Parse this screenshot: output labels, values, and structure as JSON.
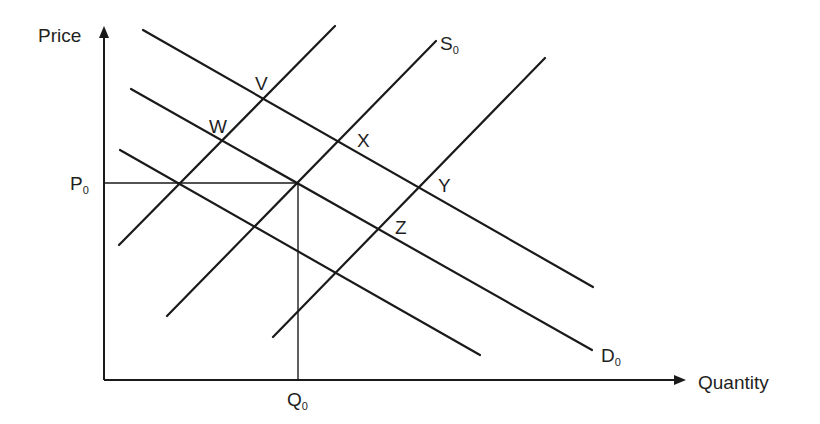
{
  "diagram": {
    "type": "supply-demand",
    "axes": {
      "y_label": "Price",
      "x_label": "Quantity"
    },
    "reference": {
      "price_label": "P",
      "price_sub": "0",
      "quantity_label": "Q",
      "quantity_sub": "0"
    },
    "curves": {
      "supply_label": "S",
      "supply_sub": "0",
      "demand_label": "D",
      "demand_sub": "0"
    },
    "points": [
      {
        "label": "V"
      },
      {
        "label": "W"
      },
      {
        "label": "X"
      },
      {
        "label": "Y"
      },
      {
        "label": "Z"
      }
    ],
    "colors": {
      "line": "#1a1a1a",
      "background": "#ffffff"
    }
  }
}
